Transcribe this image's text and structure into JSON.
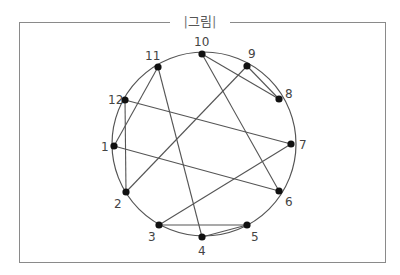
{
  "figure": {
    "title": "그림",
    "circle": {
      "cx": 204,
      "cy": 144,
      "r": 92
    },
    "points": [
      {
        "id": "1",
        "x": 114,
        "y": 146,
        "lx": 101,
        "ly": 151
      },
      {
        "id": "2",
        "x": 126,
        "y": 192,
        "lx": 114,
        "ly": 208
      },
      {
        "id": "3",
        "x": 159,
        "y": 225,
        "lx": 148,
        "ly": 241
      },
      {
        "id": "4",
        "x": 202,
        "y": 237,
        "lx": 198,
        "ly": 255
      },
      {
        "id": "5",
        "x": 247,
        "y": 225,
        "lx": 251,
        "ly": 241
      },
      {
        "id": "6",
        "x": 279,
        "y": 191,
        "lx": 285,
        "ly": 206
      },
      {
        "id": "7",
        "x": 291,
        "y": 144,
        "lx": 299,
        "ly": 149
      },
      {
        "id": "8",
        "x": 279,
        "y": 99,
        "lx": 285,
        "ly": 98
      },
      {
        "id": "9",
        "x": 247,
        "y": 66,
        "lx": 248,
        "ly": 58
      },
      {
        "id": "10",
        "x": 202,
        "y": 54,
        "lx": 194,
        "ly": 46
      },
      {
        "id": "11",
        "x": 158,
        "y": 67,
        "lx": 145,
        "ly": 60
      },
      {
        "id": "12",
        "x": 125,
        "y": 100,
        "lx": 108,
        "ly": 104
      }
    ],
    "edges": [
      [
        "1",
        "11"
      ],
      [
        "1",
        "6"
      ],
      [
        "2",
        "12"
      ],
      [
        "2",
        "9"
      ],
      [
        "3",
        "7"
      ],
      [
        "3",
        "5"
      ],
      [
        "4",
        "11"
      ],
      [
        "4",
        "5"
      ],
      [
        "6",
        "10"
      ],
      [
        "7",
        "12"
      ],
      [
        "8",
        "10"
      ],
      [
        "8",
        "9"
      ]
    ]
  }
}
